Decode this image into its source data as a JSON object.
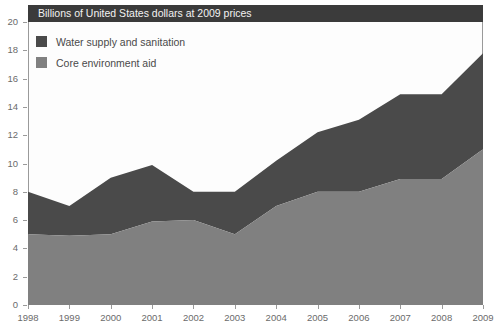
{
  "chart_data": {
    "type": "area",
    "stacked": true,
    "title": "",
    "subtitle": "Billions of United States dollars at 2009 prices",
    "xlabel": "",
    "ylabel": "",
    "xlim": [
      1998,
      2009
    ],
    "ylim": [
      0,
      20
    ],
    "ytick_step": 2,
    "grid": false,
    "legend_position": "top-left",
    "categories": [
      1998,
      1999,
      2000,
      2001,
      2002,
      2003,
      2004,
      2005,
      2006,
      2007,
      2008,
      2009
    ],
    "x_tick_labels": [
      "1998",
      "1999",
      "2000",
      "2001",
      "2002",
      "2003",
      "2004",
      "2005",
      "2006",
      "2007",
      "2008",
      "2009"
    ],
    "y_tick_labels": [
      "0",
      "2",
      "4",
      "6",
      "8",
      "10",
      "12",
      "14",
      "16",
      "18",
      "20"
    ],
    "y_tick_values": [
      0,
      2,
      4,
      6,
      8,
      10,
      12,
      14,
      16,
      18,
      20
    ],
    "series": [
      {
        "name": "Core environment aid",
        "color": "#808080",
        "values": [
          5.0,
          4.9,
          5.0,
          5.9,
          6.0,
          5.0,
          7.0,
          8.0,
          8.0,
          8.9,
          8.9,
          11.0
        ]
      },
      {
        "name": "Water supply and sanitation",
        "color": "#4a4a4a",
        "values": [
          3.0,
          2.1,
          4.0,
          4.0,
          2.0,
          3.0,
          3.2,
          4.2,
          5.1,
          6.0,
          6.0,
          6.8
        ]
      }
    ],
    "cumulative_totals": [
      8.0,
      7.0,
      9.0,
      9.9,
      8.0,
      8.0,
      10.2,
      12.2,
      13.1,
      14.9,
      14.9,
      17.8
    ]
  },
  "legend": {
    "items": [
      {
        "label": "Water supply and sanitation",
        "color": "#4a4a4a"
      },
      {
        "label": "Core environment aid",
        "color": "#808080"
      }
    ]
  },
  "header": {
    "subtitle": "Billions of United States dollars at 2009 prices",
    "background": "#3b3b3b",
    "text_color": "#f2f2f2"
  },
  "colors": {
    "water_supply_and_sanitation": "#4a4a4a",
    "core_environment_aid": "#808080",
    "axis": "#9a9a9a",
    "tick_text": "#6b6b6b",
    "plot_background": "#fdfdfd"
  }
}
